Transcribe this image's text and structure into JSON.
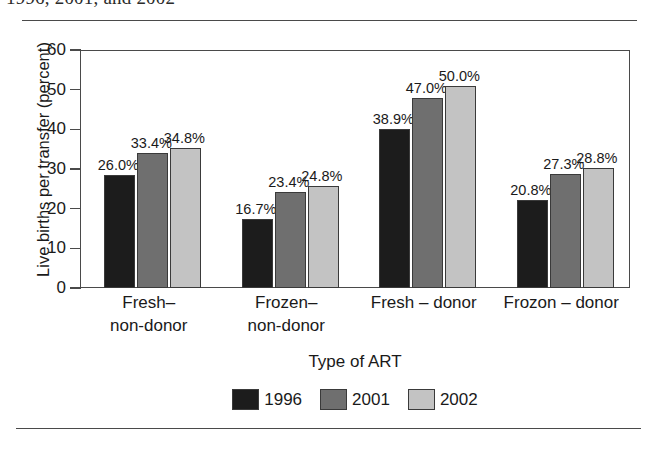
{
  "figure": {
    "caption_clipped": "1996, 2001, and 2002",
    "rule_color": "#4a4a4a"
  },
  "chart_data": {
    "type": "bar",
    "title": "",
    "xlabel": "Type of ART",
    "ylabel": "Live births per transfer (percent)",
    "categories": [
      "Fresh–\nnon-donor",
      "Frozen–\nnon-donor",
      "Fresh – donor",
      "Frozon – donor"
    ],
    "category_lines": [
      [
        "Fresh–",
        "non-donor"
      ],
      [
        "Frozen–",
        "non-donor"
      ],
      [
        "Fresh – donor",
        ""
      ],
      [
        "Frozon – donor",
        ""
      ]
    ],
    "series": [
      {
        "name": "1996",
        "color": "#1c1c1c",
        "values": [
          26.0,
          16.7,
          38.9,
          20.8
        ],
        "bar_heights": [
          28.5,
          17.4,
          40.0,
          22.3
        ],
        "labels": [
          "26.0%",
          "16.7%",
          "38.9%",
          "20.8%"
        ]
      },
      {
        "name": "2001",
        "color": "#6f6f6f",
        "values": [
          33.4,
          23.4,
          47.0,
          27.3
        ],
        "bar_heights": [
          34.0,
          24.2,
          48.0,
          28.8
        ],
        "labels": [
          "33.4%",
          "23.4%",
          "47.0%",
          "27.3%"
        ]
      },
      {
        "name": "2002",
        "color": "#c3c3c3",
        "values": [
          34.8,
          24.8,
          50.0,
          28.8
        ],
        "bar_heights": [
          35.4,
          25.8,
          51.0,
          30.2
        ],
        "labels": [
          "34.8%",
          "24.8%",
          "50.0%",
          "28.8%"
        ]
      }
    ],
    "ylim": [
      0,
      60
    ],
    "yticks": [
      0,
      10,
      20,
      30,
      40,
      50,
      60
    ],
    "ytick_labels": [
      "0",
      "10",
      "20",
      "30",
      "40",
      "50",
      "60"
    ],
    "grid": false,
    "legend_position": "bottom-center",
    "legend_entries": [
      "1996",
      "2001",
      "2002"
    ]
  }
}
